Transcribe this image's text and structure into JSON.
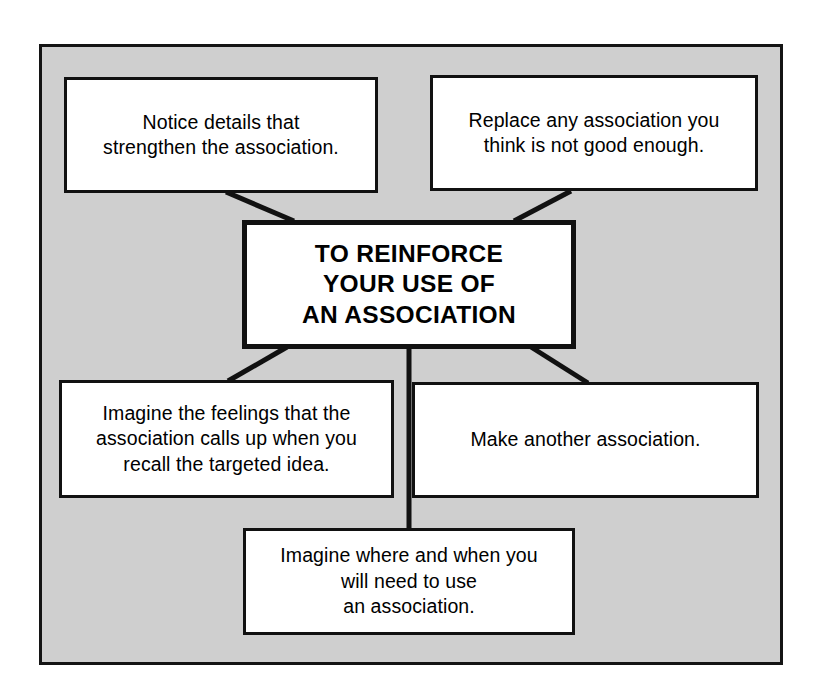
{
  "diagram": {
    "type": "concept-map",
    "title_node": {
      "id": "center",
      "name": "center-node",
      "text": "TO REINFORCE\nYOUR USE OF\nAN ASSOCIATION"
    },
    "nodes": [
      {
        "id": "notice-details",
        "name": "notice-details-node",
        "text": "Notice details that\nstrengthen the association.",
        "position": "top-left"
      },
      {
        "id": "replace-association",
        "name": "replace-association-node",
        "text": "Replace any association you\nthink is not good enough.",
        "position": "top-right"
      },
      {
        "id": "imagine-feelings",
        "name": "imagine-feelings-node",
        "text": "Imagine the feelings that the\nassociation calls up when you\nrecall the targeted idea.",
        "position": "middle-left"
      },
      {
        "id": "make-another",
        "name": "make-another-node",
        "text": "Make another association.",
        "position": "middle-right"
      },
      {
        "id": "imagine-where",
        "name": "imagine-where-node",
        "text": "Imagine where and when you\nwill need to use\nan association.",
        "position": "bottom-center"
      }
    ],
    "connectors": [
      {
        "from": "notice-details",
        "to": "center",
        "name": "connector-notice-details-to-center"
      },
      {
        "from": "replace-association",
        "to": "center",
        "name": "connector-replace-association-to-center"
      },
      {
        "from": "imagine-feelings",
        "to": "center",
        "name": "connector-imagine-feelings-to-center"
      },
      {
        "from": "make-another",
        "to": "center",
        "name": "connector-make-another-to-center"
      },
      {
        "from": "imagine-where",
        "to": "center",
        "name": "connector-imagine-where-to-center"
      }
    ],
    "colors": {
      "panel_background": "#cfcfcf",
      "node_background": "#ffffff",
      "stroke": "#111111",
      "text": "#000000",
      "page_background": "#ffffff"
    }
  }
}
